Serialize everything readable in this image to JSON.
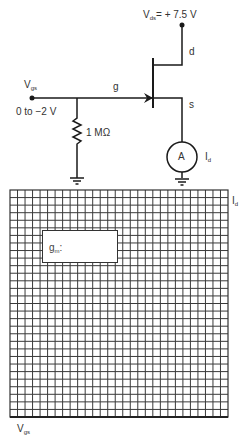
{
  "circuit": {
    "supply": {
      "symbol": "V",
      "subscript": "ds",
      "value": "= + 7.5 V"
    },
    "input": {
      "symbol": "V",
      "subscript": "gs",
      "range": "0 to −2 V"
    },
    "terminals": {
      "gate": "g",
      "drain": "d",
      "source": "s"
    },
    "resistor": {
      "value": "1 MΩ"
    },
    "ammeter": {
      "symbol": "A",
      "label_symbol": "I",
      "label_subscript": "d"
    }
  },
  "graph": {
    "y_axis": {
      "symbol": "I",
      "subscript": "d"
    },
    "x_axis": {
      "symbol": "V",
      "subscript": "gs"
    },
    "grid": {
      "columns": 29,
      "rows": 30
    },
    "answer_box": {
      "label_symbol": "g",
      "label_subscript": "m",
      "label_suffix": ":"
    }
  },
  "colors": {
    "line": "#1a1a1a",
    "grid": "#3a3a3a",
    "background": "#ffffff"
  }
}
